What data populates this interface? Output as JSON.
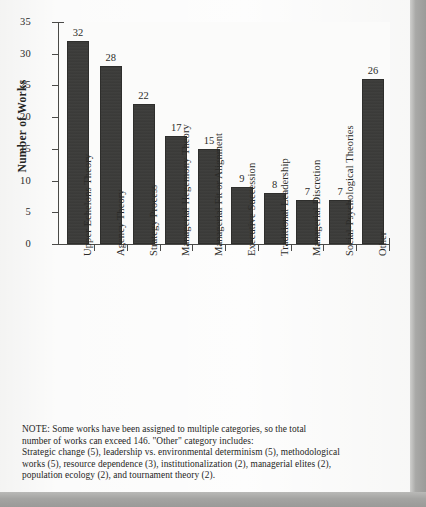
{
  "chart_data": {
    "type": "bar",
    "title": "",
    "xlabel": "",
    "ylabel": "Number of Works",
    "ylim": [
      0,
      35
    ],
    "ytick_step": 5,
    "yticks": [
      "0",
      "5",
      "10",
      "15",
      "20",
      "25",
      "30",
      "35"
    ],
    "grid": false,
    "legend": "none",
    "orientation": "vertical",
    "bar_color": "#3b3b39",
    "plot_background": "#fbfbfa",
    "categories": [
      "Upper Echelons Theory",
      "Agency Theory",
      "Strategy Process",
      "Managerial Hegemony Theory",
      "Managerial Fit or Alignment",
      "Executive Succession",
      "Traditional Leadership",
      "Managerial Discretion",
      "Social-Psychological Theories",
      "Other"
    ],
    "values": [
      32,
      28,
      22,
      17,
      15,
      9,
      8,
      7,
      7,
      26
    ],
    "value_labels": [
      "32",
      "28",
      "22",
      "17",
      "15",
      "9",
      "8",
      "7",
      "7",
      "26"
    ]
  },
  "note": {
    "lines": [
      "NOTE:  Some works have been assigned to multiple categories, so the total",
      "number of works can exceed 146.  \"Other\" category includes:",
      "Strategic change (5), leadership vs. environmental determinism (5), methodological",
      "works (5), resource dependence (3), institutionalization (2), managerial elites (2),",
      "population ecology (2), and tournament theory (2)."
    ]
  }
}
